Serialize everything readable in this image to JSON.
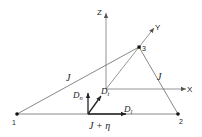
{
  "diagram": {
    "nodes": [
      {
        "id": "1",
        "label": "1",
        "x": 17,
        "y": 114
      },
      {
        "id": "2",
        "label": "2",
        "x": 178,
        "y": 114
      },
      {
        "id": "3",
        "label": "3",
        "x": 139,
        "y": 47
      }
    ],
    "edges": [
      {
        "from": "1",
        "to": "3",
        "label": "J"
      },
      {
        "from": "3",
        "to": "2",
        "label": "J"
      },
      {
        "from": "1",
        "to": "2",
        "label": "J + η"
      }
    ],
    "axes": {
      "z_label": "Z",
      "x_label": "X",
      "y_label": "Y"
    },
    "vectors": {
      "normal": {
        "main": "D",
        "sub": "n"
      },
      "tangential": {
        "main": "D",
        "sub": "t"
      },
      "longitudinal": {
        "main": "D",
        "sub": "l"
      }
    },
    "colors": {
      "line": "#6a6a6a",
      "vector": "#222222",
      "node": "#111111"
    }
  }
}
